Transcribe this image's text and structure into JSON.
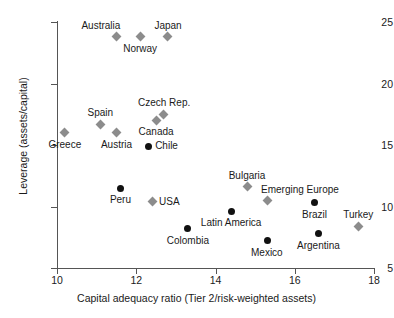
{
  "chart_data": {
    "type": "scatter",
    "title": "",
    "xlabel": "Capital adequacy ratio (Tier 2/risk-weighted assets)",
    "ylabel": "Leverage (assets/capital)",
    "xlim": [
      10,
      18
    ],
    "ylim": [
      5,
      25
    ],
    "xticks": [
      "10",
      "12",
      "14",
      "16",
      "18"
    ],
    "yticks": [
      "5",
      "10",
      "15",
      "20",
      "25"
    ],
    "grid": false,
    "legend": "none",
    "series": [
      {
        "name": "Advanced economies",
        "marker": "grey-diamond",
        "color": "#8c8c8c",
        "points": [
          {
            "label": "Australia",
            "x": 11.5,
            "y": 23.8,
            "label_pos": "above-left"
          },
          {
            "label": "Norway",
            "x": 12.1,
            "y": 23.8,
            "label_pos": "below"
          },
          {
            "label": "Japan",
            "x": 12.8,
            "y": 23.8,
            "label_pos": "above"
          },
          {
            "label": "Greece",
            "x": 10.2,
            "y": 16.0,
            "label_pos": "below"
          },
          {
            "label": "Spain",
            "x": 11.1,
            "y": 16.7,
            "label_pos": "above"
          },
          {
            "label": "Austria",
            "x": 11.5,
            "y": 16.0,
            "label_pos": "below"
          },
          {
            "label": "Canada",
            "x": 12.5,
            "y": 17.0,
            "label_pos": "below"
          },
          {
            "label": "Czech Rep.",
            "x": 12.7,
            "y": 17.5,
            "label_pos": "above"
          },
          {
            "label": "USA",
            "x": 12.4,
            "y": 10.4,
            "label_pos": "right"
          },
          {
            "label": "Bulgaria",
            "x": 14.8,
            "y": 11.6,
            "label_pos": "above"
          },
          {
            "label": "Emerging Europe",
            "x": 15.3,
            "y": 10.5,
            "label_pos": "above-right"
          },
          {
            "label": "Turkey",
            "x": 17.6,
            "y": 8.4,
            "label_pos": "above"
          }
        ]
      },
      {
        "name": "Emerging markets",
        "marker": "black-circle",
        "color": "#111111",
        "points": [
          {
            "label": "Chile",
            "x": 12.3,
            "y": 14.9,
            "label_pos": "right"
          },
          {
            "label": "Peru",
            "x": 11.6,
            "y": 11.5,
            "label_pos": "below"
          },
          {
            "label": "Latin America",
            "x": 14.4,
            "y": 9.6,
            "label_pos": "below"
          },
          {
            "label": "Colombia",
            "x": 13.3,
            "y": 8.2,
            "label_pos": "below"
          },
          {
            "label": "Mexico",
            "x": 15.3,
            "y": 7.2,
            "label_pos": "below"
          },
          {
            "label": "Brazil",
            "x": 16.5,
            "y": 10.3,
            "label_pos": "below"
          },
          {
            "label": "Argentina",
            "x": 16.6,
            "y": 7.8,
            "label_pos": "below"
          }
        ]
      }
    ]
  }
}
